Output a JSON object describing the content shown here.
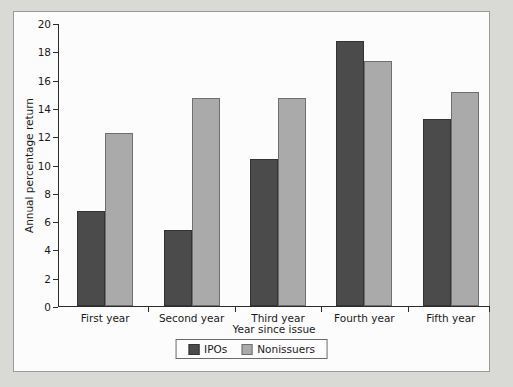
{
  "chart_data": {
    "type": "bar",
    "title": "",
    "xlabel": "Year since issue",
    "ylabel": "Annual percentage return",
    "categories": [
      "First year",
      "Second year",
      "Third year",
      "Fourth year",
      "Fifth year"
    ],
    "series": [
      {
        "name": "IPOs",
        "color": "#4b4b4b",
        "values": [
          6.7,
          5.35,
          10.4,
          18.75,
          13.25
        ]
      },
      {
        "name": "Nonissuers",
        "color": "#aaaaaa",
        "values": [
          12.2,
          14.7,
          14.7,
          17.3,
          15.1
        ]
      }
    ],
    "ylim": [
      0,
      20
    ],
    "ytick_step": 2,
    "yticks": [
      0,
      2,
      4,
      6,
      8,
      10,
      12,
      14,
      16,
      18,
      20
    ],
    "grid": false,
    "legend_position": "bottom-center"
  },
  "legend": {
    "entries": [
      {
        "label": "IPOs",
        "swatch": "ipos"
      },
      {
        "label": "Nonissuers",
        "swatch": "nonissuers"
      }
    ]
  },
  "colors": {
    "page_background": "#d9d9d6",
    "panel_background": "#fcfcfc",
    "panel_border": "#9a9a9a",
    "axis": "#2b2b2b",
    "ipos": "#4b4b4b",
    "nonissuers": "#aaaaaa"
  }
}
